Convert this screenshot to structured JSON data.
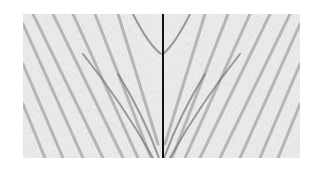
{
  "figure": {
    "colors": {
      "background": "#ffffff",
      "panel": "#f3f3f3",
      "band_dark": "#6a6a6a",
      "band_mid": "#a8a8a8",
      "center_line": "#111111"
    }
  }
}
